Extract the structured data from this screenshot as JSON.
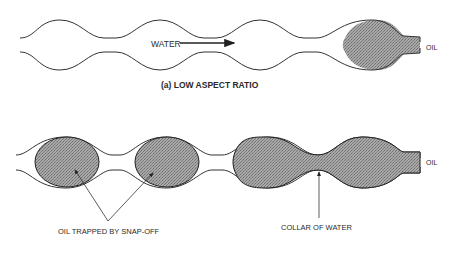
{
  "figure": {
    "panel_a": {
      "caption": "(a) LOW ASPECT RATIO",
      "flow_label": "WATER",
      "outlet_label": "OIL"
    },
    "panel_b": {
      "outlet_label": "OIL",
      "annotation_snapoff": "OIL TRAPPED BY SNAP-OFF",
      "annotation_collar": "COLLAR OF WATER"
    }
  },
  "colors": {
    "wall": "#333333",
    "oil_fill": "#9a9a9a",
    "text": "#2a2a2a"
  }
}
